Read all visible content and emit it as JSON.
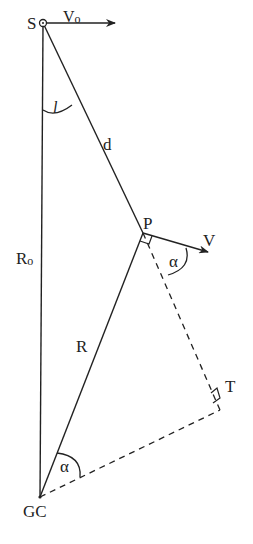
{
  "diagram": {
    "type": "geometry",
    "points": {
      "S": {
        "label": "S",
        "x": 43,
        "y": 23
      },
      "P": {
        "label": "P",
        "x": 143,
        "y": 233
      },
      "GC": {
        "label": "GC",
        "x": 40,
        "y": 497
      },
      "T": {
        "label": "T",
        "x": 220,
        "y": 410
      }
    },
    "labels": {
      "S": "S",
      "V0_main": "V",
      "V0_sub": "o",
      "l": "l",
      "d": "d",
      "P": "P",
      "V": "V",
      "alpha_P": "α",
      "R0_main": "R",
      "R0_sub": "o",
      "R": "R",
      "T": "T",
      "alpha_GC": "α",
      "GC": "GC"
    },
    "segments": [
      {
        "from": "S",
        "to": "GC",
        "label": "Ro",
        "style": "solid"
      },
      {
        "from": "S",
        "to": "P",
        "label": "d",
        "style": "solid"
      },
      {
        "from": "GC",
        "to": "P",
        "label": "R",
        "style": "solid"
      },
      {
        "from": "P",
        "to": "T",
        "style": "dashed"
      },
      {
        "from": "GC",
        "to": "T",
        "style": "dashed"
      }
    ],
    "vectors": [
      {
        "from": "S",
        "label": "Vo",
        "direction": "horizontal-right"
      },
      {
        "from": "P",
        "label": "V",
        "direction": "perpendicular to R"
      }
    ],
    "angles": [
      {
        "vertex": "S",
        "label": "l"
      },
      {
        "vertex": "P",
        "label": "α"
      },
      {
        "vertex": "GC",
        "label": "α"
      }
    ],
    "right_angles": [
      "P",
      "T"
    ],
    "colors": {
      "ink": "#222222",
      "background": "#ffffff"
    }
  }
}
